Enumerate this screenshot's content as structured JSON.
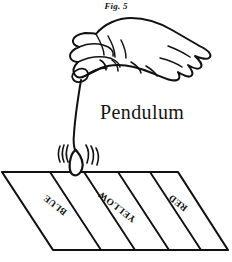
{
  "figure": {
    "caption": "Fig. 5",
    "background_color": "#ffffff",
    "ink_color": "#111111",
    "width": 232,
    "height": 262
  },
  "annotation": {
    "pendulum_label": "Pendulum"
  },
  "hand": {
    "name": "hand-holding-pendulum",
    "description": "closed hand gripping pendulum string"
  },
  "pendulum": {
    "string": "pendulum-string",
    "bob": "pendulum-bob",
    "swing_marks_left": 3,
    "swing_marks_right": 3
  },
  "board": {
    "name": "striped-board",
    "stripe_count": 5,
    "stripes": [
      {
        "label": "",
        "color_name": ""
      },
      {
        "label": "BLUE",
        "color_name": "blue"
      },
      {
        "label": "",
        "color_name": ""
      },
      {
        "label": "YELLOW",
        "color_name": "yellow"
      },
      {
        "label": "RED",
        "color_name": "red"
      }
    ],
    "labels": [
      {
        "text": "BLUE",
        "x": 54,
        "y": 205,
        "rotation": 218
      },
      {
        "text": "YELLOW",
        "x": 116,
        "y": 207,
        "rotation": 218
      },
      {
        "text": "RED",
        "x": 177,
        "y": 203,
        "rotation": 218
      }
    ]
  }
}
